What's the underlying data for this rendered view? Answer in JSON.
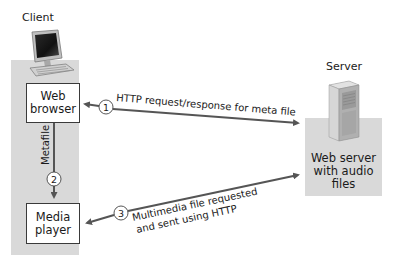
{
  "client": {
    "title": "Client",
    "web_browser": {
      "line1": "Web",
      "line2": "browser"
    },
    "media_player": {
      "line1": "Media",
      "line2": "player"
    },
    "metafile_label": "Metafile"
  },
  "server": {
    "title": "Server",
    "box": {
      "line1": "Web server",
      "line2": "with audio",
      "line3": "files"
    }
  },
  "steps": [
    {
      "number": "1",
      "label": "HTTP request/response for meta file"
    },
    {
      "number": "2",
      "label": ""
    },
    {
      "number": "3",
      "label_line1": "Multimedia file requested",
      "label_line2": "and sent using HTTP"
    }
  ],
  "colors": {
    "panel": "#d9d9d9",
    "arrow": "#555555",
    "box_border": "#3a3a3a"
  }
}
